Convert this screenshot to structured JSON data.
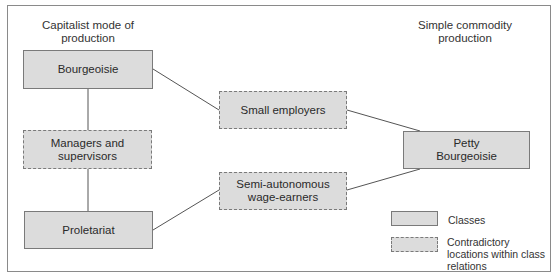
{
  "headings": {
    "left": "Capitalist mode of production",
    "right": "Simple commodity production"
  },
  "nodes": {
    "bourgeoisie": {
      "label": "Bourgeoisie",
      "type": "class"
    },
    "managers": {
      "label": "Managers and supervisors",
      "type": "contradictory"
    },
    "proletariat": {
      "label": "Proletariat",
      "type": "class"
    },
    "small_employers": {
      "label": "Small employers",
      "type": "contradictory"
    },
    "semi_autonomous": {
      "label": "Semi-autonomous wage-earners",
      "type": "contradictory"
    },
    "petty_bourgeoisie": {
      "label": "Petty Bourgeoisie",
      "type": "class"
    }
  },
  "edges": [
    [
      "bourgeoisie",
      "managers"
    ],
    [
      "managers",
      "proletariat"
    ],
    [
      "bourgeoisie",
      "small_employers"
    ],
    [
      "small_employers",
      "petty_bourgeoisie"
    ],
    [
      "proletariat",
      "semi_autonomous"
    ],
    [
      "semi_autonomous",
      "petty_bourgeoisie"
    ]
  ],
  "legend": {
    "classes": "Classes",
    "contradictory": "Contradictory locations within class relations"
  },
  "colors": {
    "box_fill": "#dcdcdc",
    "box_border": "#7a7a7a",
    "line": "#555555"
  }
}
